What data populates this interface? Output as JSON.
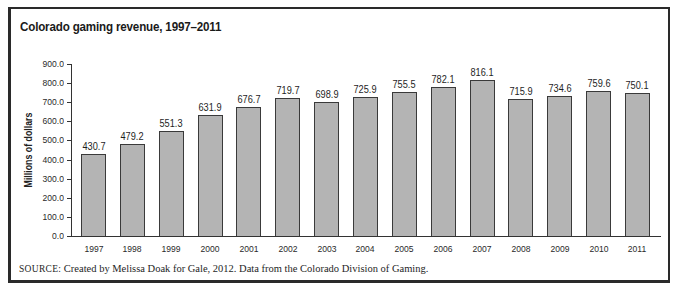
{
  "chart_data": {
    "type": "bar",
    "title": "Colorado gaming revenue, 1997–2011",
    "xlabel": "",
    "ylabel": "Millions of dollars",
    "ylim": [
      0,
      900
    ],
    "yticks": [
      "0.0",
      "100.0",
      "200.0",
      "300.0",
      "400.0",
      "500.0",
      "600.0",
      "700.0",
      "800.0",
      "900.0"
    ],
    "grid": false,
    "legend": null,
    "categories": [
      "1997",
      "1998",
      "1999",
      "2000",
      "2001",
      "2002",
      "2003",
      "2004",
      "2005",
      "2006",
      "2007",
      "2008",
      "2009",
      "2010",
      "2011"
    ],
    "values": [
      430.7,
      479.2,
      551.3,
      631.9,
      676.7,
      719.7,
      698.9,
      725.9,
      755.5,
      782.1,
      816.1,
      715.9,
      734.6,
      759.6,
      750.1
    ],
    "value_labels": [
      "430.7",
      "479.2",
      "551.3",
      "631.9",
      "676.7",
      "719.7",
      "698.9",
      "725.9",
      "755.5",
      "782.1",
      "816.1",
      "715.9",
      "734.6",
      "759.6",
      "750.1"
    ],
    "bar_color": "#b4b4b4",
    "source_prefix": "SOURCE:",
    "source_text": " Created by Melissa Doak for Gale, 2012. Data from the Colorado Division of Gaming."
  }
}
